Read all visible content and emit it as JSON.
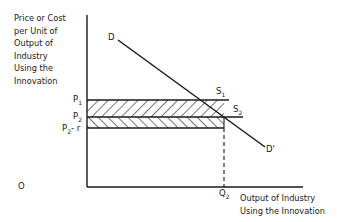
{
  "diagram": {
    "y_axis_label_lines": [
      "Price or Cost",
      "per Unit of",
      "Output of",
      "Industry",
      "Using the",
      "Innovation"
    ],
    "x_axis_label_lines": [
      "Output of Industry",
      "Using the Innovation"
    ],
    "origin_label": "O",
    "price_labels": {
      "p1": {
        "main": "P",
        "sub": "1"
      },
      "p2": {
        "main": "P",
        "sub": "2"
      },
      "p2r": {
        "main": "P",
        "sub": "2",
        "suffix": "- r"
      }
    },
    "quantity_label": {
      "main": "Q",
      "sub": "2"
    },
    "curve_labels": {
      "demand_start": "D",
      "demand_end": "D'",
      "supply1": {
        "main": "S",
        "sub": "1"
      },
      "supply2": {
        "main": "S",
        "sub": "2"
      }
    },
    "shaded_regions": [
      {
        "name": "upper-band",
        "between": "P1-P2",
        "hatch": "forward-diagonal"
      },
      {
        "name": "lower-band",
        "between": "P2-(P2-r)",
        "hatch": "back-diagonal"
      }
    ],
    "colors": {
      "ink": "#1a1a1a",
      "background": "#ffffff"
    }
  }
}
